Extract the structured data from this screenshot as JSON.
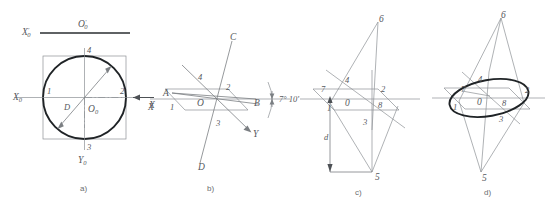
{
  "figure": {
    "title_visible": false,
    "background_color": "#ffffff",
    "ink_color": "#55585c",
    "heavy_ink_color": "#1f2326",
    "panels": [
      {
        "id": "a",
        "caption": "a)",
        "description": "front view of circle in square with isometric axes",
        "labels": {
          "axis_x0_prime": "X",
          "axis_x0_prime_prime": "'",
          "axis_x0_prime_sub": "0",
          "origin_prime": "O",
          "origin_prime_prime": "'",
          "origin_prime_sub": "0",
          "axis_x0": "X",
          "axis_x0_sub": "0",
          "axis_y0": "Y",
          "axis_y0_sub": "0",
          "origin": "O",
          "origin_sub": "0",
          "axis_x_arrow": "X",
          "diameter": "D",
          "p1": "1",
          "p2": "2",
          "p3": "3",
          "p4": "4"
        }
      },
      {
        "id": "b",
        "caption": "b)",
        "description": "isometric plane with trace lines C-D and angle callout",
        "labels": {
          "line_c": "C",
          "line_d": "D",
          "point_a": "A",
          "point_b": "B",
          "origin": "O",
          "axis_y": "Y",
          "axis_x": "X",
          "angle": "7° 10'",
          "p1": "1",
          "p2": "2",
          "p3": "3",
          "p4": "4"
        }
      },
      {
        "id": "c",
        "caption": "c)",
        "description": "construction with apex points 5 and 6 and dimension d",
        "labels": {
          "p1": "1",
          "p2": "2",
          "p3": "3",
          "p4": "4",
          "p5": "5",
          "p6": "6",
          "p7": "7",
          "p8": "8",
          "origin": "0",
          "dimension": "d"
        }
      },
      {
        "id": "d",
        "caption": "d)",
        "description": "finished ellipse inscribed in the isometric parallelogram",
        "labels": {
          "p1": "1",
          "p2": "2",
          "p3": "3",
          "p4": "4",
          "p5": "5",
          "p6": "6",
          "p7": "7",
          "p8": "8",
          "origin": "0"
        }
      }
    ]
  }
}
